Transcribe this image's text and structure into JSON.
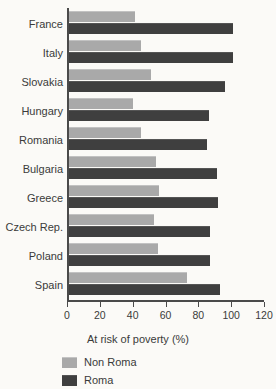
{
  "chart_data": {
    "type": "bar",
    "orientation": "horizontal",
    "title": "",
    "xlabel": "At risk of poverty (%)",
    "ylabel": "",
    "xlim": [
      0,
      120
    ],
    "xticks": [
      0,
      20,
      40,
      60,
      80,
      100,
      120
    ],
    "xtick_labels": [
      "0",
      "20",
      "40",
      "60",
      "80",
      "100",
      "120"
    ],
    "grid": false,
    "legend_position": "bottom-left",
    "categories": [
      "France",
      "Italy",
      "Slovakia",
      "Hungary",
      "Romania",
      "Bulgaria",
      "Greece",
      "Czech Rep.",
      "Poland",
      "Spain"
    ],
    "series": [
      {
        "name": "Non Roma",
        "color": "#a9a9a9",
        "values": [
          40,
          44,
          50,
          39,
          44,
          53,
          55,
          52,
          54,
          72
        ]
      },
      {
        "name": "Roma",
        "color": "#3f3f3f",
        "values": [
          100,
          100,
          95,
          85,
          84,
          90,
          91,
          86,
          86,
          92
        ]
      }
    ]
  },
  "legend": {
    "items": [
      {
        "label": "Non Roma",
        "color": "#a9a9a9"
      },
      {
        "label": "Roma",
        "color": "#3f3f3f"
      }
    ]
  }
}
